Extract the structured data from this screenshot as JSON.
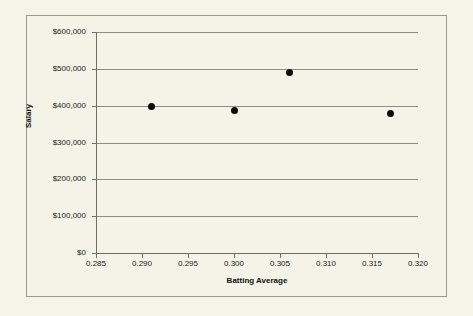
{
  "chart_data": {
    "type": "scatter",
    "title": "",
    "xlabel": "Batting Average",
    "ylabel": "Salary",
    "xlim": [
      0.285,
      0.32
    ],
    "ylim": [
      0,
      600000
    ],
    "grid": "horizontal",
    "legend": "none",
    "x_tick_labels": [
      "0.285",
      "0.290",
      "0.295",
      "0.300",
      "0.305",
      "0.310",
      "0.315",
      "0.320"
    ],
    "x_tick_values": [
      0.285,
      0.29,
      0.295,
      0.3,
      0.305,
      0.31,
      0.315,
      0.32
    ],
    "y_tick_labels": [
      "$0",
      "$100,000",
      "$200,000",
      "$300,000",
      "$400,000",
      "$500,000",
      "$600,000"
    ],
    "y_tick_values": [
      0,
      100000,
      200000,
      300000,
      400000,
      500000,
      600000
    ],
    "points": [
      {
        "x": 0.291,
        "y": 397000
      },
      {
        "x": 0.3,
        "y": 388000
      },
      {
        "x": 0.306,
        "y": 490000
      },
      {
        "x": 0.317,
        "y": 379000
      }
    ],
    "marker": {
      "shape": "circle",
      "color": "#0d0d0d",
      "size": 7
    },
    "colors": {
      "background": "#f4f3e8",
      "gridline": "#8d8d85",
      "axis": "#6e6e66",
      "text": "#1b1b1b",
      "border": "#9a9a90"
    }
  }
}
